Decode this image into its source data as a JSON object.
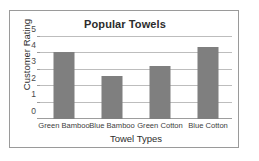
{
  "chart_data": {
    "type": "bar",
    "title": "Popular Towels",
    "xlabel": "Towel Types",
    "ylabel": "Customer Rating",
    "categories": [
      "Green Bamboo",
      "Blue Bamboo",
      "Green Cotton",
      "Blue Cotton"
    ],
    "values": [
      4.1,
      2.6,
      3.25,
      4.4
    ],
    "ylim": [
      0,
      5
    ],
    "yticks": [
      "0",
      "1",
      "2",
      "3",
      "4",
      "5"
    ],
    "ytick_values": [
      0,
      1,
      2,
      3,
      4,
      5
    ],
    "grid": true,
    "legend": false,
    "legend_position": "none",
    "series": [
      {
        "name": "Customer Rating",
        "values": [
          4.1,
          2.6,
          3.25,
          4.4
        ]
      }
    ],
    "colors": {
      "bar": "#7f7f7f",
      "gridline": "#bdbdbd",
      "axis": "#9d9d9d",
      "frame_border": "#9a9a9a",
      "background": "#ffffff",
      "title_text": "#2c2c2c",
      "label_text": "#3d3d3d"
    }
  }
}
